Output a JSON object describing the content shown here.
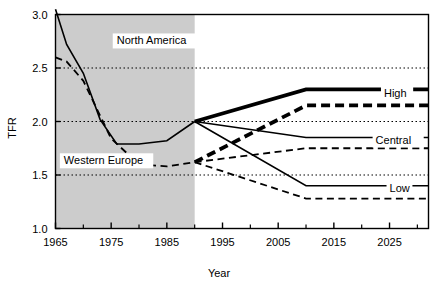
{
  "chart_data": {
    "type": "line",
    "title": "",
    "xlabel": "Year",
    "ylabel": "TFR",
    "xlim": [
      1965,
      2032
    ],
    "ylim": [
      1.0,
      3.0
    ],
    "yticks": [
      "1.0",
      "1.5",
      "2.0",
      "2.5",
      "3.0"
    ],
    "ytick_values": [
      1.0,
      1.5,
      2.0,
      2.5,
      3.0
    ],
    "xticks": [
      "1965",
      "1975",
      "1985",
      "1995",
      "2005",
      "2015",
      "2025"
    ],
    "xtick_values": [
      1965,
      1975,
      1985,
      1995,
      2005,
      2015,
      2025
    ],
    "xminor_values": [
      1970,
      1980,
      1990,
      2000,
      2010,
      2020,
      2030
    ],
    "grid": "horizontal-dotted",
    "legend_position": "inline-right",
    "shaded_region": {
      "label": "historical",
      "x_start": 1965,
      "x_end": 1990,
      "color": "#cccccc"
    },
    "annotations": [
      {
        "name": "north-america-label",
        "text": "North America",
        "x": 1976,
        "y": 2.72
      },
      {
        "name": "western-europe-label",
        "text": "Western Europe",
        "x": 1966.5,
        "y": 1.6
      }
    ],
    "series": [
      {
        "name": "North America historical",
        "style": "solid-thin",
        "region": "North America",
        "x": [
          1965,
          1967,
          1970,
          1973,
          1976,
          1980,
          1985,
          1990
        ],
        "values": [
          3.05,
          2.72,
          2.45,
          2.02,
          1.79,
          1.79,
          1.82,
          2.0
        ]
      },
      {
        "name": "Western Europe historical",
        "style": "dashed-thin",
        "region": "Western Europe",
        "x": [
          1965,
          1967,
          1970,
          1975,
          1980,
          1985,
          1990
        ],
        "values": [
          2.6,
          2.56,
          2.38,
          1.84,
          1.6,
          1.58,
          1.62
        ]
      },
      {
        "name": "North America High",
        "label": "High",
        "style": "solid-thick",
        "region": "North America",
        "x": [
          1990,
          2010,
          2032
        ],
        "values": [
          2.0,
          2.3,
          2.3
        ]
      },
      {
        "name": "Western Europe High",
        "label": "High",
        "style": "dashed-thick",
        "region": "Western Europe",
        "x": [
          1990,
          2010,
          2032
        ],
        "values": [
          1.62,
          2.15,
          2.15
        ]
      },
      {
        "name": "North America Central",
        "label": "Central",
        "style": "solid-thin",
        "region": "North America",
        "x": [
          1990,
          2010,
          2032
        ],
        "values": [
          2.0,
          1.85,
          1.85
        ]
      },
      {
        "name": "Western Europe Central",
        "label": "Central",
        "style": "dashed-thin",
        "region": "Western Europe",
        "x": [
          1990,
          2010,
          2032
        ],
        "values": [
          1.62,
          1.75,
          1.75
        ]
      },
      {
        "name": "North America Low",
        "label": "Low",
        "style": "solid-thin",
        "region": "North America",
        "x": [
          1990,
          2010,
          2032
        ],
        "values": [
          2.0,
          1.4,
          1.4
        ]
      },
      {
        "name": "Western Europe Low",
        "label": "Low",
        "style": "dashed-thin",
        "region": "Western Europe",
        "x": [
          1990,
          2010,
          2032
        ],
        "values": [
          1.62,
          1.28,
          1.28
        ]
      }
    ],
    "series_labels": [
      {
        "name": "high-label",
        "text": "High",
        "x": 2024,
        "y": 2.23
      },
      {
        "name": "central-label",
        "text": "Central",
        "x": 2022.5,
        "y": 1.79
      },
      {
        "name": "low-label",
        "text": "Low",
        "x": 2025,
        "y": 1.345
      }
    ],
    "colors": {
      "line": "#000000",
      "shade": "#cccccc",
      "grid": "#000000",
      "background": "#ffffff"
    }
  }
}
